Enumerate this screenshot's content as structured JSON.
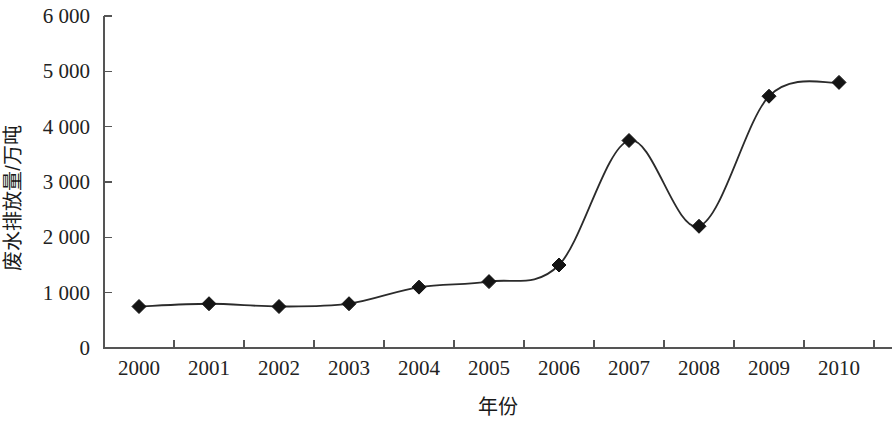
{
  "chart_data": {
    "type": "line",
    "title": "",
    "xlabel": "年份",
    "ylabel": "废水排放量/万吨",
    "categories": [
      "2000",
      "2001",
      "2002",
      "2003",
      "2004",
      "2005",
      "2006",
      "2007",
      "2008",
      "2009",
      "2010"
    ],
    "values": [
      750,
      800,
      750,
      800,
      1100,
      1200,
      1500,
      3750,
      2200,
      4550,
      4800
    ],
    "series": [
      {
        "name": "废水排放量",
        "values": [
          750,
          800,
          750,
          800,
          1100,
          1200,
          1500,
          3750,
          2200,
          4550,
          4800
        ]
      }
    ],
    "ylim": [
      0,
      6000
    ],
    "y_ticks": [
      0,
      1000,
      2000,
      3000,
      4000,
      5000,
      6000
    ],
    "y_tick_labels": [
      "0",
      "1 000",
      "2 000",
      "3 000",
      "4 000",
      "5 000",
      "6 000"
    ],
    "x_tick_labels": [
      "2000",
      "2001",
      "2002",
      "2003",
      "2004",
      "2005",
      "2006",
      "2007",
      "2008",
      "2009",
      "2010"
    ],
    "grid": false,
    "legend": "none",
    "marker": "diamond",
    "line_color": "#2b2b2b",
    "marker_color": "#141414",
    "axis_color": "#555555",
    "smoothing": "spline"
  },
  "axes": {
    "y_title": "废水排放量/万吨",
    "x_title": "年份"
  }
}
